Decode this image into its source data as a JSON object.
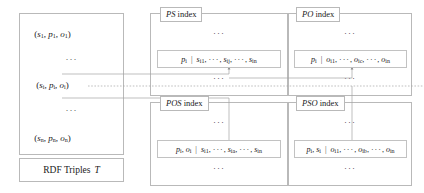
{
  "diagram": {
    "left_panel": {
      "label": "RDF Triples T",
      "label_plain": "RDF Triples",
      "label_italic": "T",
      "triples": [
        {
          "id": "triple-1",
          "s": "s",
          "s_sub": "1",
          "p": "p",
          "p_sub": "1",
          "o": "o",
          "o_sub": "1",
          "text": "(s1, p1, o1)"
        },
        {
          "id": "triple-i",
          "s": "s",
          "s_sub": "i",
          "p": "p",
          "p_sub": "i",
          "o": "o",
          "o_sub": "i",
          "text": "(si, pi, oi)"
        },
        {
          "id": "triple-n",
          "s": "s",
          "s_sub": "n",
          "p": "p",
          "p_sub": "n",
          "o": "o",
          "o_sub": "n",
          "text": "(sn, pn, on)"
        }
      ],
      "ellipsis": "···"
    },
    "indexes": [
      {
        "id": "ps-index",
        "title_italic": "PS",
        "title_rest": " index",
        "title": "PS index",
        "entry_key": "pi",
        "entry_values": "si1, ···, sij, ···, sin",
        "entry_text": "pi | si1, ···, sij, ···, sin",
        "ellipsis_top": "···",
        "ellipsis_bottom": "···"
      },
      {
        "id": "po-index",
        "title_italic": "PO",
        "title_rest": " index",
        "title": "PO index",
        "entry_key": "pi",
        "entry_values": "oi1, ···, oic, ···, oin",
        "entry_text": "pi | oi1, ···, oic, ···, oin",
        "ellipsis_top": "···",
        "ellipsis_bottom": "···"
      },
      {
        "id": "pos-index",
        "title_italic": "POS",
        "title_rest": " index",
        "title": "POS index",
        "entry_key": "pi, oi",
        "entry_values": "si1, ···, sia, ···, sin",
        "entry_text": "pi, oi | si1, ···, sia, ···, sin",
        "ellipsis_top": "···",
        "ellipsis_bottom": "···"
      },
      {
        "id": "pso-index",
        "title_italic": "PSO",
        "title_rest": " index",
        "title": "PSO index",
        "entry_key": "pi, si",
        "entry_values": "oi1, ···, oib, ···, oin",
        "entry_text": "pi, si | oi1, ···, oib, ···, oin",
        "ellipsis_top": "···",
        "ellipsis_bottom": "···"
      }
    ],
    "colors": {
      "border": "#b9b9b9",
      "entry_border": "#c2c2c2",
      "connector": "#9a9a9a",
      "text": "#1a1a1a",
      "background": "#ffffff"
    }
  }
}
